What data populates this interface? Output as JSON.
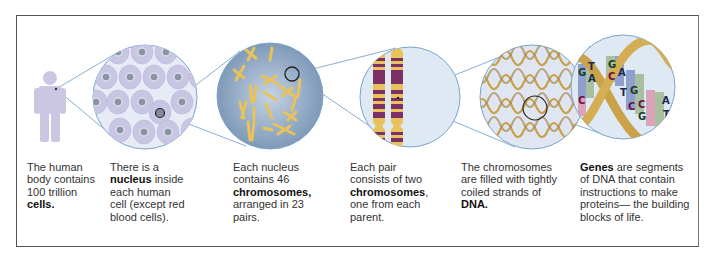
{
  "diagram": {
    "colors": {
      "zoom_lines": "#7aa6cc",
      "figure": "#cbc7e3",
      "cell_bg": "#dde3f1",
      "nucleus_bg": "#8ea6c3",
      "chromosome_yellow": "#e8c25a",
      "chromosome_purple": "#7e2f66",
      "dna_gold": "#c9a24a",
      "circle_bg": "#dfe9f4"
    },
    "stages": [
      {
        "id": "body",
        "icon": "human-figure-icon",
        "caption": {
          "pre": "The human body contains 100 trillion ",
          "bold": "cells.",
          "post": ""
        }
      },
      {
        "id": "cell",
        "icon": "cells-icon",
        "caption": {
          "pre": "There is a ",
          "bold": "nucleus",
          "post": " inside each human cell (except red blood cells)."
        }
      },
      {
        "id": "nucleus",
        "icon": "nucleus-chromosomes-icon",
        "caption": {
          "pre": "Each nucleus contains 46 ",
          "bold": "chromosomes,",
          "post": " arranged in 23 pairs."
        }
      },
      {
        "id": "chromosome-pair",
        "icon": "chromosome-pair-icon",
        "caption": {
          "pre": "Each pair consists of two ",
          "bold": "chromosomes",
          "post": ", one from each parent."
        }
      },
      {
        "id": "dna",
        "icon": "dna-strands-icon",
        "caption": {
          "pre": "The chromosomes are filled with tightly coiled strands of ",
          "bold": "DNA.",
          "post": ""
        }
      },
      {
        "id": "genes",
        "icon": "gene-helix-icon",
        "caption": {
          "pre": "",
          "bold": "Genes",
          "post": " are segments of DNA that contain instructions to make proteins— the building blocks of life."
        }
      }
    ],
    "base_pairs": [
      {
        "top": "T",
        "bottom": "A"
      },
      {
        "top": "G",
        "bottom": "C"
      },
      {
        "top": "A",
        "bottom": "T"
      },
      {
        "top": "G",
        "bottom": "C"
      },
      {
        "top": "C",
        "bottom": "G"
      },
      {
        "top": "A",
        "bottom": "T"
      },
      {
        "top": "G",
        "bottom": "C"
      }
    ]
  }
}
